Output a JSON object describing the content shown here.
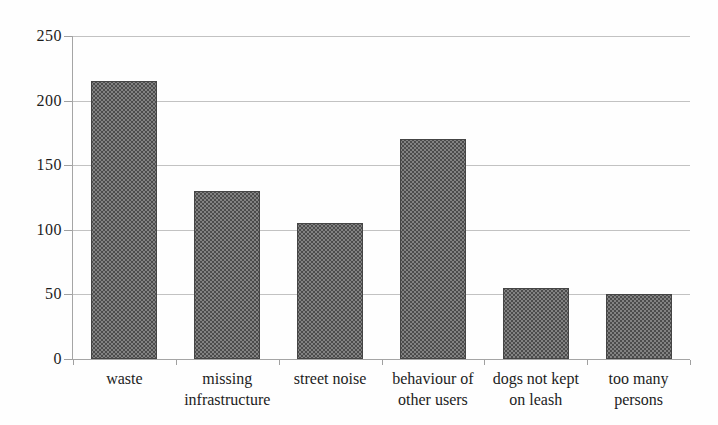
{
  "figure": {
    "background": "#fefefe",
    "bar_fill": "#828282",
    "bar_dot_color": "#4c4c4c",
    "bar_border": "#454545",
    "grid_color": "#c2c2c2",
    "axis_color": "#a5a5a5",
    "text_color": "#1c1c1c"
  },
  "chart_data": {
    "type": "bar",
    "title": "",
    "xlabel": "",
    "ylabel": "",
    "categories": [
      "waste",
      "missing infrastructure",
      "street noise",
      "behaviour of other users",
      "dogs not kept on leash",
      "too many persons"
    ],
    "category_label_lines": [
      [
        "waste"
      ],
      [
        "missing",
        "infrastructure"
      ],
      [
        "street noise"
      ],
      [
        "behaviour of",
        "other users"
      ],
      [
        "dogs not kept",
        "on leash"
      ],
      [
        "too many",
        "persons"
      ]
    ],
    "values": [
      215,
      130,
      105,
      170,
      55,
      50
    ],
    "ylim": [
      0,
      250
    ],
    "yticks": [
      0,
      50,
      100,
      150,
      200,
      250
    ],
    "ytick_labels": [
      "0",
      "50",
      "100",
      "150",
      "200",
      "250"
    ],
    "grid": "horizontal-dotted",
    "legend": "none",
    "bar_color": "halftone-gray"
  }
}
